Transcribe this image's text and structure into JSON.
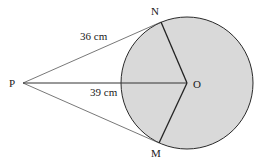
{
  "diagram": {
    "points": {
      "P": {
        "label": "P",
        "x": 23,
        "y": 83
      },
      "O": {
        "label": "O",
        "x": 187,
        "y": 83
      },
      "N": {
        "label": "N",
        "x": 161,
        "y": 22
      },
      "M": {
        "label": "M",
        "x": 159,
        "y": 143
      }
    },
    "circle": {
      "cx": 187,
      "cy": 83,
      "r": 66,
      "fill": "#d9d9d9",
      "stroke": "#2a2a2a"
    },
    "segments": [
      {
        "from": "P",
        "to": "N",
        "label": "36 cm"
      },
      {
        "from": "P",
        "to": "O",
        "label": "39 cm"
      },
      {
        "from": "P",
        "to": "M",
        "label": ""
      },
      {
        "from": "O",
        "to": "N",
        "label": ""
      },
      {
        "from": "O",
        "to": "M",
        "label": ""
      }
    ],
    "labels": {
      "pn_length": "36 cm",
      "po_length": "39 cm",
      "p": "P",
      "o": "O",
      "n": "N",
      "m": "M"
    }
  }
}
